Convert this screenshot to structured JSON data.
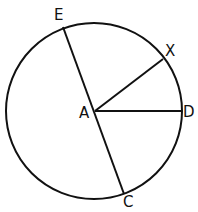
{
  "diagram": {
    "type": "circle-geometry",
    "stroke_color": "#111111",
    "background": "#ffffff",
    "circle": {
      "center": [
        94,
        111
      ],
      "radius": 88
    },
    "center_point": {
      "label": "A",
      "pos": [
        95,
        111
      ]
    },
    "points": [
      {
        "id": "E",
        "label": "E",
        "pos": [
          63,
          27
        ]
      },
      {
        "id": "X",
        "label": "X",
        "pos": [
          163,
          59
        ]
      },
      {
        "id": "D",
        "label": "D",
        "pos": [
          181,
          111
        ]
      },
      {
        "id": "C",
        "label": "C",
        "pos": [
          124,
          194
        ]
      }
    ],
    "segments": [
      {
        "name": "EC",
        "from": "E",
        "to": "C",
        "note": "diameter through A"
      },
      {
        "name": "AX",
        "from": "A",
        "to": "X"
      },
      {
        "name": "AD",
        "from": "A",
        "to": "D"
      }
    ],
    "labels": {
      "A": "A",
      "E": "E",
      "X": "X",
      "D": "D",
      "C": "C"
    }
  }
}
